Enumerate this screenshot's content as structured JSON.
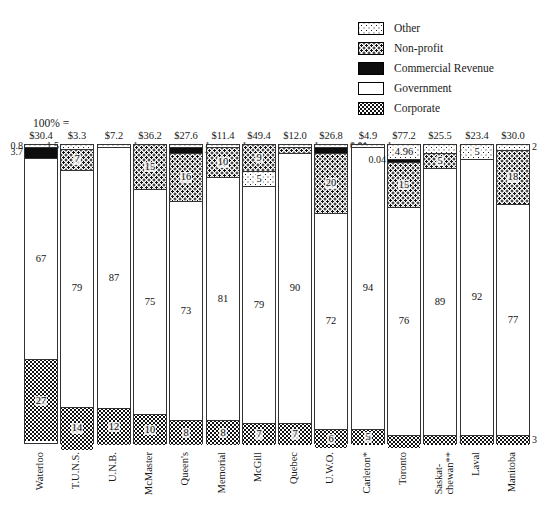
{
  "legend": {
    "position": "top-right",
    "items": [
      {
        "label": "Other",
        "pattern": "pat-other"
      },
      {
        "label": "Non-profit",
        "pattern": "pat-nonprofit"
      },
      {
        "label": "Commercial Revenue",
        "pattern": "pat-commercial"
      },
      {
        "label": "Government",
        "pattern": "pat-government"
      },
      {
        "label": "Corporate",
        "pattern": "pat-corporate"
      }
    ]
  },
  "axis_caption": "100% =",
  "chart_data": {
    "type": "bar",
    "title": "",
    "xlabel": "",
    "ylabel": "",
    "ylim": [
      0,
      100
    ],
    "grid": false,
    "stacked": true,
    "units": "percent of total funding; totals in millions of dollars",
    "legend_position": "top-right",
    "categories": [
      "Waterloo",
      "T.U.N.S.",
      "U.N.B.",
      "McMaster",
      "Queen's",
      "Memorial",
      "McGill",
      "Quebec",
      "U.W.O.",
      "Carleton*",
      "Toronto",
      "Saskat-\nchewan**",
      "Laval",
      "Manitoba"
    ],
    "totals": [
      "$30.4",
      "$3.3",
      "$7.2",
      "$36.2",
      "$27.6",
      "$11.4",
      "$49.4",
      "$12.0",
      "$26.8",
      "$4.9",
      "$77.2",
      "$25.5",
      "$23.4",
      "$30.0"
    ],
    "series": [
      {
        "name": "Other",
        "values": [
          0.8,
          1.5,
          1,
          0,
          1,
          1,
          5,
          1,
          0.01,
          1,
          4.96,
          3,
          5,
          2
        ]
      },
      {
        "name": "Non-profit",
        "values": [
          0,
          7,
          0,
          15,
          16,
          10,
          9,
          2,
          20,
          0,
          15,
          5,
          0,
          18
        ]
      },
      {
        "name": "Commercial Revenue",
        "values": [
          3.7,
          0,
          0,
          0,
          2,
          0,
          0,
          0,
          1.99,
          0,
          0.04,
          0,
          0,
          0
        ]
      },
      {
        "name": "Government",
        "values": [
          67,
          79,
          87,
          75,
          73,
          81,
          79,
          90,
          72,
          94,
          76,
          89,
          92,
          77
        ]
      },
      {
        "name": "Corporate",
        "values": [
          27,
          14,
          12,
          10,
          8,
          8,
          7,
          7,
          6,
          5,
          4,
          3,
          3,
          3
        ]
      }
    ],
    "bars": [
      {
        "category": "Waterloo",
        "total": "$30.4",
        "segments": [
          {
            "type": "Other",
            "value": 0.8,
            "label": "0.8",
            "label_side": "left"
          },
          {
            "type": "Commercial Revenue",
            "value": 3.7,
            "label": "3.7",
            "label_side": "left"
          },
          {
            "type": "Government",
            "value": 67,
            "label": "67",
            "label_side": "inside"
          },
          {
            "type": "Corporate",
            "value": 27,
            "label": "27",
            "label_side": "inside"
          }
        ]
      },
      {
        "category": "T.U.N.S.",
        "total": "$3.3",
        "segments": [
          {
            "type": "Other",
            "value": 1.5,
            "label": "1.5",
            "label_side": "left"
          },
          {
            "type": "Non-profit",
            "value": 7,
            "label": "7",
            "label_side": "inside"
          },
          {
            "type": "Government",
            "value": 79,
            "label": "79",
            "label_side": "inside"
          },
          {
            "type": "Corporate",
            "value": 14,
            "label": "14",
            "label_side": "inside"
          }
        ]
      },
      {
        "category": "U.N.B.",
        "total": "$7.2",
        "segments": [
          {
            "type": "Other",
            "value": 1,
            "label": "1",
            "label_side": "right"
          },
          {
            "type": "Government",
            "value": 87,
            "label": "87",
            "label_side": "inside"
          },
          {
            "type": "Corporate",
            "value": 12,
            "label": "12",
            "label_side": "inside"
          }
        ]
      },
      {
        "category": "McMaster",
        "total": "$36.2",
        "segments": [
          {
            "type": "Non-profit",
            "value": 15,
            "label": "15",
            "label_side": "inside"
          },
          {
            "type": "Government",
            "value": 75,
            "label": "75",
            "label_side": "inside"
          },
          {
            "type": "Corporate",
            "value": 10,
            "label": "10",
            "label_side": "inside"
          }
        ]
      },
      {
        "category": "Queen's",
        "total": "$27.6",
        "segments": [
          {
            "type": "Other",
            "value": 1,
            "label": "1",
            "label_side": "right"
          },
          {
            "type": "Commercial Revenue",
            "value": 2,
            "label": "2",
            "label_side": "right"
          },
          {
            "type": "Non-profit",
            "value": 16,
            "label": "16",
            "label_side": "inside"
          },
          {
            "type": "Government",
            "value": 73,
            "label": "73",
            "label_side": "inside"
          },
          {
            "type": "Corporate",
            "value": 8,
            "label": "8",
            "label_side": "inside"
          }
        ]
      },
      {
        "category": "Memorial",
        "total": "$11.4",
        "segments": [
          {
            "type": "Other",
            "value": 1,
            "label": "1",
            "label_side": "right"
          },
          {
            "type": "Non-profit",
            "value": 10,
            "label": "10",
            "label_side": "inside"
          },
          {
            "type": "Government",
            "value": 81,
            "label": "81",
            "label_side": "inside"
          },
          {
            "type": "Corporate",
            "value": 8,
            "label": "8",
            "label_side": "inside"
          }
        ]
      },
      {
        "category": "McGill",
        "total": "$49.4",
        "segments": [
          {
            "type": "Non-profit",
            "value": 9,
            "label": "9",
            "label_side": "inside"
          },
          {
            "type": "Other",
            "value": 5,
            "label": "5",
            "label_side": "inside"
          },
          {
            "type": "Government",
            "value": 79,
            "label": "79",
            "label_side": "inside"
          },
          {
            "type": "Corporate",
            "value": 7,
            "label": "7",
            "label_side": "inside"
          }
        ]
      },
      {
        "category": "Quebec",
        "total": "$12.0",
        "segments": [
          {
            "type": "Other",
            "value": 1,
            "label": "1",
            "label_side": "right"
          },
          {
            "type": "Non-profit",
            "value": 2,
            "label": "2",
            "label_side": "right"
          },
          {
            "type": "Government",
            "value": 90,
            "label": "90",
            "label_side": "inside"
          },
          {
            "type": "Corporate",
            "value": 7,
            "label": "7",
            "label_side": "inside"
          }
        ]
      },
      {
        "category": "U.W.O.",
        "total": "$26.8",
        "segments": [
          {
            "type": "Other",
            "value": 0.01,
            "label": "0.01",
            "label_side": "right"
          },
          {
            "type": "Commercial Revenue",
            "value": 1.99,
            "label": "1.99",
            "label_side": "right"
          },
          {
            "type": "Non-profit",
            "value": 20,
            "label": "20",
            "label_side": "inside"
          },
          {
            "type": "Government",
            "value": 72,
            "label": "72",
            "label_side": "inside"
          },
          {
            "type": "Corporate",
            "value": 6,
            "label": "6",
            "label_side": "inside"
          }
        ]
      },
      {
        "category": "Carleton*",
        "total": "$4.9",
        "segments": [
          {
            "type": "Other",
            "value": 1,
            "label": "1",
            "label_side": "right"
          },
          {
            "type": "Government",
            "value": 94,
            "label": "94",
            "label_side": "inside"
          },
          {
            "type": "Corporate",
            "value": 5,
            "label": "5",
            "label_side": "inside"
          }
        ]
      },
      {
        "category": "Toronto",
        "total": "$77.2",
        "segments": [
          {
            "type": "Other",
            "value": 4.96,
            "label": "4.96",
            "label_side": "inside"
          },
          {
            "type": "Commercial Revenue",
            "value": 0.04,
            "label": "0.04",
            "label_side": "left"
          },
          {
            "type": "Non-profit",
            "value": 15,
            "label": "15",
            "label_side": "inside"
          },
          {
            "type": "Government",
            "value": 76,
            "label": "76",
            "label_side": "inside"
          },
          {
            "type": "Corporate",
            "value": 4,
            "label": "4",
            "label_side": "right"
          }
        ]
      },
      {
        "category": "Saskat-\nchewan**",
        "total": "$25.5",
        "segments": [
          {
            "type": "Other",
            "value": 3,
            "label": "3",
            "label_side": "right"
          },
          {
            "type": "Non-profit",
            "value": 5,
            "label": "5",
            "label_side": "inside"
          },
          {
            "type": "Government",
            "value": 89,
            "label": "89",
            "label_side": "inside"
          },
          {
            "type": "Corporate",
            "value": 3,
            "label": "3",
            "label_side": "right"
          }
        ]
      },
      {
        "category": "Laval",
        "total": "$23.4",
        "segments": [
          {
            "type": "Other",
            "value": 5,
            "label": "5",
            "label_side": "inside"
          },
          {
            "type": "Government",
            "value": 92,
            "label": "92",
            "label_side": "inside"
          },
          {
            "type": "Corporate",
            "value": 3,
            "label": "3",
            "label_side": "right"
          }
        ]
      },
      {
        "category": "Manitoba",
        "total": "$30.0",
        "segments": [
          {
            "type": "Other",
            "value": 2,
            "label": "2",
            "label_side": "right"
          },
          {
            "type": "Non-profit",
            "value": 18,
            "label": "18",
            "label_side": "inside"
          },
          {
            "type": "Government",
            "value": 77,
            "label": "77",
            "label_side": "inside"
          },
          {
            "type": "Corporate",
            "value": 3,
            "label": "3",
            "label_side": "right"
          }
        ]
      }
    ]
  }
}
